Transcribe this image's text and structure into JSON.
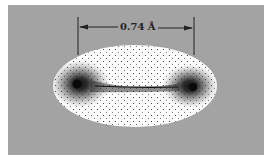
{
  "figure": {
    "bond_length_label": "0.74 Å",
    "colors": {
      "background": "#a3a3a3",
      "cloud": "#ffffff",
      "density": "#1a1a1a"
    }
  }
}
